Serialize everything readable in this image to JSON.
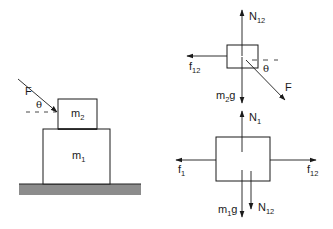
{
  "diagram": {
    "setup": {
      "ground": {
        "fill": "#8c8c8c",
        "line": "#222222"
      },
      "block_lower": {
        "label": "m",
        "subscript": "1"
      },
      "block_upper": {
        "label": "m",
        "subscript": "2"
      },
      "applied_force": {
        "label": "F"
      },
      "angle": {
        "label": "θ"
      }
    },
    "fbd_upper": {
      "block": {
        "name": "m2"
      },
      "forces": {
        "normal": {
          "label": "N",
          "subscript": "12",
          "direction": "up"
        },
        "friction": {
          "label": "f",
          "subscript": "12",
          "direction": "left"
        },
        "weight": {
          "label_pre": "m",
          "subscript": "2",
          "label_post": "g",
          "direction": "down"
        },
        "applied": {
          "label": "F",
          "direction": "down-right"
        }
      },
      "angle": {
        "label": "θ"
      }
    },
    "fbd_lower": {
      "block": {
        "name": "m1"
      },
      "forces": {
        "normal": {
          "label": "N",
          "subscript": "1",
          "direction": "up"
        },
        "friction_ground": {
          "label": "f",
          "subscript": "1",
          "direction": "left"
        },
        "friction_top": {
          "label": "f",
          "subscript": "12",
          "direction": "right"
        },
        "weight": {
          "label_pre": "m",
          "subscript": "1",
          "label_post": "g",
          "direction": "down"
        },
        "normal_top": {
          "label": "N",
          "subscript": "12",
          "direction": "down"
        }
      }
    },
    "stroke_color": "#1a1a1a"
  }
}
